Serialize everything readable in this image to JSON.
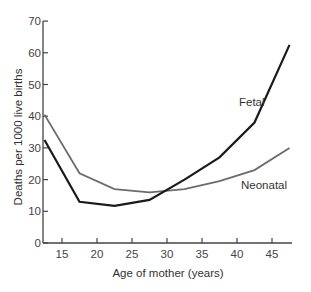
{
  "chart_data": {
    "type": "line",
    "title": "",
    "xlabel": "Age of mother (years)",
    "ylabel": "Deaths per 1000 live births",
    "xlim": [
      12.5,
      48
    ],
    "ylim": [
      0,
      70
    ],
    "x_ticks": [
      15,
      20,
      25,
      30,
      35,
      40,
      45
    ],
    "y_ticks": [
      0,
      10,
      20,
      30,
      40,
      50,
      60,
      70
    ],
    "grid": false,
    "legend": "inline labels",
    "x": [
      12.5,
      17.5,
      22.5,
      27.5,
      32.5,
      37.5,
      42.5,
      47.5
    ],
    "series": [
      {
        "name": "Fetal",
        "color": "#1a1a1a",
        "values": [
          32.5,
          13,
          11.7,
          13.6,
          20,
          27,
          38,
          62.5
        ]
      },
      {
        "name": "Neonatal",
        "color": "#6b6b6b",
        "values": [
          40.5,
          22,
          17,
          16,
          17,
          19.5,
          23,
          30
        ]
      }
    ]
  }
}
